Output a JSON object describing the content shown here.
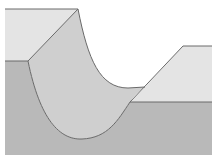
{
  "diagram": {
    "type": "geological-cross-section",
    "colors": {
      "background": "#ffffff",
      "upper_layer": "#e4e4e4",
      "lower_layer": "#b9b9b9",
      "valley_fill": "#cfcfcf",
      "stroke": "#6a6a6a"
    }
  }
}
